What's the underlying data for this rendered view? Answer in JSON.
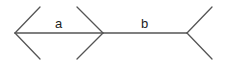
{
  "figure": {
    "type": "muller-lyer-illusion",
    "segments": [
      {
        "label": "a",
        "from": [
          15,
          33
        ],
        "to": [
          103,
          33
        ],
        "fins": "outward-arrowheads"
      },
      {
        "label": "b",
        "from": [
          103,
          33
        ],
        "to": [
          187,
          33
        ],
        "fins": "inward-tails"
      }
    ],
    "labels": {
      "a": "a",
      "b": "b"
    },
    "line_color": "#555555"
  }
}
